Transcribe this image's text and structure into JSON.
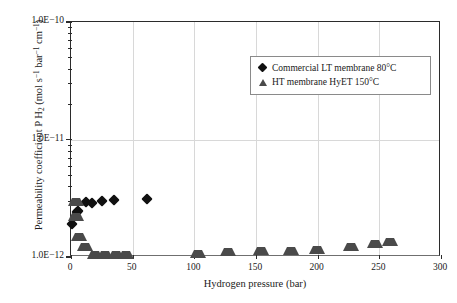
{
  "chart_data": {
    "type": "scatter",
    "title": "",
    "xlabel": "Hydrogen pressure (bar)",
    "ylabel_html": "Permeability coefficient P H<sub>2</sub> (mol s<sup>−1</sup> bar<sup>−1</sup> cm<sup>−1</sup>)",
    "ylabel": "Permeability coefficient P H2 (mol s-1 bar-1 cm-1)",
    "xlim": [
      0,
      300
    ],
    "ylim": [
      1e-12,
      1e-10
    ],
    "yscale": "log",
    "xscale": "linear",
    "grid": true,
    "grid_color": "#d8d8d8",
    "legend_position": "top-right",
    "xticks": [
      0,
      50,
      100,
      150,
      200,
      250,
      300
    ],
    "xtick_labels": [
      "0",
      "50",
      "100",
      "150",
      "200",
      "250",
      "300"
    ],
    "yticks": [
      1e-12,
      1e-11,
      1e-10
    ],
    "ytick_labels": [
      "1.0E−12",
      "1.0E−11",
      "1.0E−10"
    ],
    "series": [
      {
        "name": "Commercial LT membrane 80°C",
        "marker": "diamond",
        "color": "#111111",
        "points": [
          {
            "x": 0.5,
            "y": 1.9e-12
          },
          {
            "x": 4.5,
            "y": 2.42e-12
          },
          {
            "x": 5.5,
            "y": 2.46e-12
          },
          {
            "x": 12.0,
            "y": 2.95e-12
          },
          {
            "x": 17.0,
            "y": 2.88e-12
          },
          {
            "x": 25.0,
            "y": 2.97e-12
          },
          {
            "x": 35.0,
            "y": 3.05e-12
          },
          {
            "x": 62.0,
            "y": 3.12e-12
          }
        ]
      },
      {
        "name": "HT membrane HyET 150°C",
        "marker": "triangle",
        "color": "#4a4a4a",
        "points": [
          {
            "x": 0.5,
            "y": 3.45e-12
          },
          {
            "x": 1.0,
            "y": 2.55e-12
          },
          {
            "x": 3.5,
            "y": 1.72e-12
          },
          {
            "x": 8.0,
            "y": 1.42e-12
          },
          {
            "x": 16.0,
            "y": 1.22e-12
          },
          {
            "x": 24.0,
            "y": 1.21e-12
          },
          {
            "x": 33.0,
            "y": 1.21e-12
          },
          {
            "x": 41.0,
            "y": 1.22e-12
          },
          {
            "x": 100.0,
            "y": 1.24e-12
          },
          {
            "x": 124.0,
            "y": 1.3e-12
          },
          {
            "x": 151.0,
            "y": 1.31e-12
          },
          {
            "x": 175.0,
            "y": 1.32e-12
          },
          {
            "x": 196.0,
            "y": 1.34e-12
          },
          {
            "x": 224.0,
            "y": 1.42e-12
          },
          {
            "x": 243.0,
            "y": 1.52e-12
          },
          {
            "x": 255.0,
            "y": 1.58e-12
          }
        ]
      }
    ]
  },
  "legend": {
    "entries": [
      {
        "label": "Commercial LT membrane 80°C",
        "marker": "diamond"
      },
      {
        "label": "HT membrane HyET 150°C",
        "marker": "triangle"
      }
    ]
  }
}
